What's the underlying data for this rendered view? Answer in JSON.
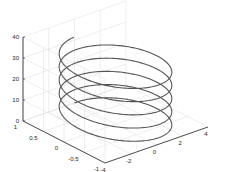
{
  "chart_data": {
    "type": "line",
    "subtype": "3d-helix",
    "title": "",
    "xlabel": "",
    "ylabel": "",
    "zlabel": "",
    "xlim": [
      -4,
      4
    ],
    "ylim": [
      -1,
      1
    ],
    "zlim": [
      0,
      40
    ],
    "xticks": [
      -4,
      -2,
      0,
      2,
      4
    ],
    "yticks": [
      -1,
      -0.5,
      0,
      0.5,
      1
    ],
    "zticks": [
      0,
      10,
      20,
      30,
      40
    ],
    "xtick_labels": [
      "-4",
      "-2",
      "0",
      "2",
      "4"
    ],
    "ytick_labels": [
      "-1",
      "-0.5",
      "0",
      "0.5",
      "1"
    ],
    "ztick_labels": [
      "0",
      "10",
      "20",
      "30",
      "40"
    ],
    "grid": true,
    "legend": null,
    "series": [
      {
        "name": "helix",
        "color": "#555555",
        "equation": "x = 3*sin(t), y = cos(t), z = t, t in [0, 10*pi]",
        "t_range": [
          0,
          31.4
        ],
        "turns": 5
      }
    ]
  },
  "colors": {
    "axis": "#262626",
    "grid": "#dcdcdc",
    "line": "#555555"
  }
}
